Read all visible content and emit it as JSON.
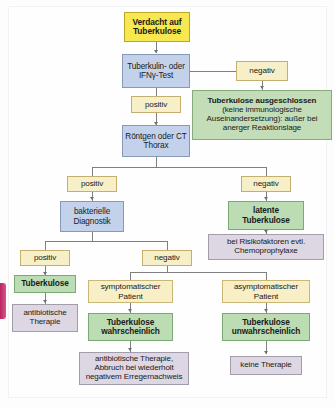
{
  "figure": {
    "language": "de"
  },
  "colors": {
    "start_fill": "#f6e84e",
    "test_fill": "#c3d2ea",
    "label_fill": "#f7efc8",
    "patient_fill": "#f8efc6",
    "conclusion_fill": "#bcdcb4",
    "therapy_fill": "#dcd7e2",
    "connector": "#7f7f7f",
    "page_bleed": "#b9245e",
    "background": "#fefefe"
  },
  "nodes": {
    "start": "Verdacht auf Tuberkulose",
    "test": "Tuberkulin- oder IFNγ-Test",
    "test_negative": "negativ",
    "test_positive": "positiv",
    "excluded": "Tuberkulose ausgeschlossen (keine immunologische Auseinandersetzung): außer bei anerger Reaktionslage",
    "excluded_head": "Tuberkulose ausgeschlossen",
    "excluded_body": "(keine immunologische Auseinandersetzung): außer bei anerger Reaktionslage",
    "imaging": "Röntgen oder CT Thorax",
    "imaging_positive": "positiv",
    "imaging_negative": "negativ",
    "bacteriology": "bakterielle Diagnostik",
    "latent_tb": "latente Tuberkulose",
    "chemoprophylaxis": "bei Risikofaktoren evtl. Chemoprophylaxe",
    "bact_positive": "positiv",
    "bact_negative": "negativ",
    "tuberculosis": "Tuberkulose",
    "antibiotic_therapy": "antibiotische Therapie",
    "symptomatic_patient": "symptomatischer Patient",
    "asymptomatic_patient": "asymptomatischer Patient",
    "tb_likely": "Tuberkulose wahrscheinlich",
    "tb_unlikely": "Tuberkulose unwahrscheinlich",
    "antibiotic_stop": "antibiotische Therapie, Abbruch bei wiederholt negativem Erregernachweis",
    "no_therapy": "keine Therapie"
  }
}
